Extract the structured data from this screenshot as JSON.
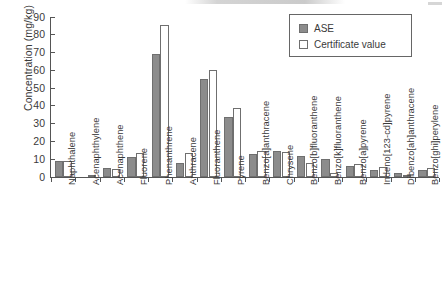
{
  "chart_data": {
    "type": "bar",
    "title": "",
    "subtitle": "",
    "xlabel": "",
    "ylabel": "Concentration (mg/kg)",
    "ylim": [
      0,
      90
    ],
    "yticks": [
      0,
      10,
      20,
      30,
      40,
      50,
      60,
      70,
      80,
      90
    ],
    "grid": false,
    "legend_position": "top-right",
    "categories": [
      "Naphthalene",
      "Acenaphthylene",
      "Acenaphthene",
      "Fluorene",
      "Phenanthrene",
      "Anthracene",
      "Fluoranthene",
      "Pyrene",
      "Benzo[a]anthracene",
      "Chrysene",
      "Benzo[b]fluoranthene",
      "Benzo[k]fluoranthene",
      "Benzo[a]pyrene",
      "Indeno[123-cd]pyrene",
      "Dibenzo[ah]anthracene",
      "Benzo[ghi]perylene"
    ],
    "series": [
      {
        "name": "ASE",
        "color": "#8c8c8c",
        "values": [
          9.0,
          0.0,
          5.0,
          11.3,
          69.0,
          8.0,
          55.0,
          33.6,
          13.0,
          14.9,
          11.6,
          10.2,
          6.2,
          4.2,
          2.2,
          3.8
        ]
      },
      {
        "name": "Certificate value",
        "color": "#ffffff",
        "values": [
          9.0,
          0.7,
          4.4,
          13.7,
          85.3,
          13.5,
          60.4,
          39.0,
          14.6,
          14.0,
          7.8,
          2.5,
          7.3,
          5.5,
          1.3,
          4.8
        ]
      }
    ]
  },
  "legend": {
    "entries": [
      {
        "label": "ASE",
        "swatch": "filled-gray"
      },
      {
        "label": "Certificate value",
        "swatch": "open-white"
      }
    ]
  },
  "colors": {
    "ase_fill": "#8c8c8c",
    "certificate_fill": "#ffffff",
    "bar_border": "#6f6f6f",
    "axis": "#555555",
    "text": "#3a3a3a"
  }
}
